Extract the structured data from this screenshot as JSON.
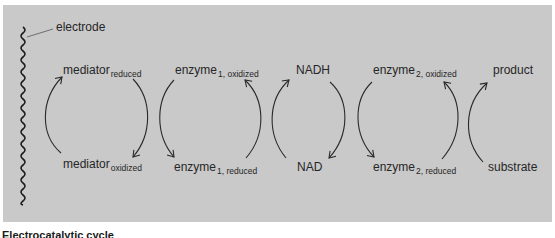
{
  "diagram": {
    "background_color": "#c9c9c9",
    "stroke_color": "#2a2a2a",
    "electrode": {
      "label": "electrode"
    },
    "cycles": [
      {
        "top": {
          "base": "mediator",
          "sub": "reduced"
        },
        "bottom": {
          "base": "mediator",
          "sub": "oxidized"
        }
      },
      {
        "top": {
          "base": "enzyme",
          "sub": "1, oxidized"
        },
        "bottom": {
          "base": "enzyme",
          "sub": "1, reduced"
        }
      },
      {
        "top": {
          "base": "NADH",
          "sub": ""
        },
        "bottom": {
          "base": "NAD",
          "sub": ""
        }
      },
      {
        "top": {
          "base": "enzyme",
          "sub": "2, oxidized"
        },
        "bottom": {
          "base": "enzyme",
          "sub": "2, reduced"
        }
      },
      {
        "top": {
          "base": "product",
          "sub": ""
        },
        "bottom": {
          "base": "substrate",
          "sub": ""
        }
      }
    ],
    "arrows": [
      {
        "from": "mediator_oxidized",
        "to": "mediator_reduced",
        "side": "left"
      },
      {
        "from": "mediator_reduced",
        "to": "mediator_oxidized",
        "side": "right"
      },
      {
        "from": "enzyme_1_oxidized",
        "to": "enzyme_1_reduced",
        "side": "left"
      },
      {
        "from": "enzyme_1_reduced",
        "to": "enzyme_1_oxidized",
        "side": "right"
      },
      {
        "from": "NAD",
        "to": "NADH",
        "side": "left"
      },
      {
        "from": "NADH",
        "to": "NAD",
        "side": "right"
      },
      {
        "from": "enzyme_2_oxidized",
        "to": "enzyme_2_reduced",
        "side": "left"
      },
      {
        "from": "enzyme_2_reduced",
        "to": "enzyme_2_oxidized",
        "side": "right"
      },
      {
        "from": "substrate",
        "to": "product",
        "side": "left"
      }
    ],
    "caption": "Electrocatalytic cycle"
  }
}
